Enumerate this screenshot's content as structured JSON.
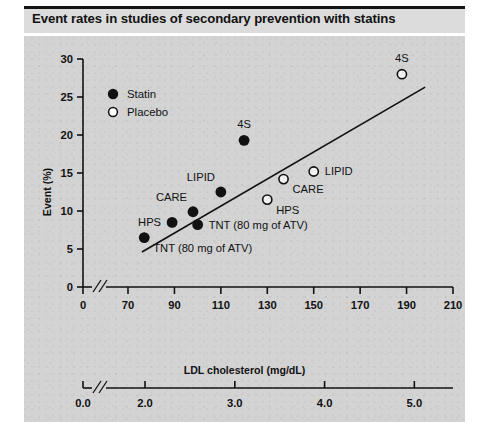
{
  "figure": {
    "title": "Event rates in studies of secondary prevention with statins",
    "background_color": "#d3d3d3",
    "title_band_color": "#dcdcdc"
  },
  "chart_data": {
    "type": "scatter",
    "title": "Event rates in studies of secondary prevention with statins",
    "xlabel": "LDL cholesterol (mg/dL)",
    "ylabel": "Event (%)",
    "xlabel_secondary": "LDL cholesterol (mmol/L)",
    "xlim": [
      60,
      215
    ],
    "ylim": [
      0,
      30
    ],
    "grid": false,
    "axis_break": true,
    "legend_position": "top-left",
    "xticks": [
      "0",
      "70",
      "90",
      "110",
      "130",
      "150",
      "170",
      "190",
      "210"
    ],
    "xticks_secondary": [
      "0.0",
      "2.0",
      "3.0",
      "4.0",
      "5.0"
    ],
    "yticks": [
      "0",
      "5",
      "10",
      "15",
      "20",
      "25",
      "30"
    ],
    "legend": [
      {
        "label": "Statin",
        "marker": "filled-circle"
      },
      {
        "label": "Placebo",
        "marker": "open-circle"
      }
    ],
    "series": [
      {
        "name": "Statin",
        "marker": "filled-circle",
        "points": [
          {
            "label": "TNT (80 mg of ATV)",
            "x": 77,
            "y": 6.5,
            "label_pos": "below-right"
          },
          {
            "label": "HPS",
            "x": 89,
            "y": 8.5,
            "label_pos": "left"
          },
          {
            "label": "TNT (80 mg of ATV)",
            "x": 100,
            "y": 8.2,
            "label_pos": "right"
          },
          {
            "label": "CARE",
            "x": 98,
            "y": 9.9,
            "label_pos": "above-left"
          },
          {
            "label": "LIPID",
            "x": 110,
            "y": 12.5,
            "label_pos": "above-left"
          },
          {
            "label": "4S",
            "x": 120,
            "y": 19.3,
            "label_pos": "above"
          }
        ]
      },
      {
        "name": "Placebo",
        "marker": "open-circle",
        "points": [
          {
            "label": "HPS",
            "x": 130,
            "y": 11.5,
            "label_pos": "below-right"
          },
          {
            "label": "CARE",
            "x": 137,
            "y": 14.2,
            "label_pos": "below-right"
          },
          {
            "label": "LIPID",
            "x": 150,
            "y": 15.2,
            "label_pos": "right"
          },
          {
            "label": "4S",
            "x": 188,
            "y": 28.0,
            "label_pos": "above"
          }
        ]
      }
    ],
    "trendline": {
      "x0": 76,
      "y0": 4.6,
      "x1": 198,
      "y1": 26.3
    }
  }
}
